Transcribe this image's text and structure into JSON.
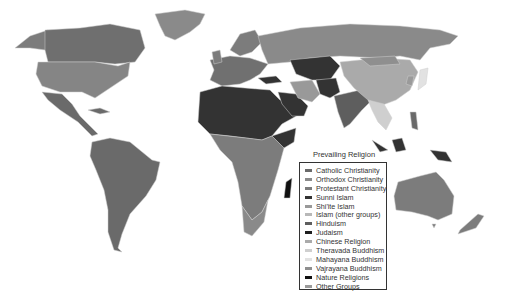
{
  "legend": {
    "title": "Prevailing Religion",
    "items": [
      {
        "label": "Catholic Christianity",
        "color": "#6a6a6a"
      },
      {
        "label": "Orthodox Christianity",
        "color": "#8a8a8a"
      },
      {
        "label": "Protestant Christianity",
        "color": "#7c7c7c"
      },
      {
        "label": "Sunni Islam",
        "color": "#333333"
      },
      {
        "label": "Shi'ite Islam",
        "color": "#999999"
      },
      {
        "label": "Islam (other groups)",
        "color": "#b8b8b8"
      },
      {
        "label": "Hinduism",
        "color": "#5e5e5e"
      },
      {
        "label": "Judaism",
        "color": "#1e1e1e"
      },
      {
        "label": "Chinese Religion",
        "color": "#aaaaaa"
      },
      {
        "label": "Theravada Buddhism",
        "color": "#cfcfcf"
      },
      {
        "label": "Mahayana Buddhism",
        "color": "#e2e2e2"
      },
      {
        "label": "Vajrayana Buddhism",
        "color": "#8f8f8f"
      },
      {
        "label": "Nature Religions",
        "color": "#111111"
      },
      {
        "label": "Other Groups",
        "color": "#9a9a9a"
      }
    ]
  }
}
